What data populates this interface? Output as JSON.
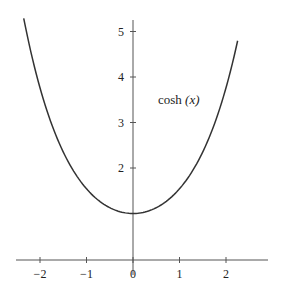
{
  "chart_data": {
    "type": "line",
    "title": "",
    "xlabel": "",
    "ylabel": "",
    "xlim": [
      -2.5,
      2.8
    ],
    "ylim": [
      0,
      5.3
    ],
    "grid": false,
    "x_ticks": [
      -2,
      -1,
      0,
      1,
      2
    ],
    "x_tick_labels": [
      "−2",
      "−1",
      "0",
      "1",
      "2"
    ],
    "y_ticks": [
      2,
      3,
      4,
      5
    ],
    "y_tick_labels": [
      "2",
      "3",
      "4",
      "5"
    ],
    "series": [
      {
        "name": "cosh (x)",
        "function": "cosh(x)",
        "domain": [
          -2.35,
          2.25
        ],
        "color": "#333333",
        "x": [
          -2.35,
          -2,
          -1.5,
          -1,
          -0.5,
          0,
          0.5,
          1,
          1.5,
          2,
          2.25
        ],
        "y": [
          5.29,
          3.76,
          2.35,
          1.54,
          1.13,
          1.0,
          1.13,
          1.54,
          2.35,
          3.76,
          4.79
        ]
      }
    ],
    "annotations": [
      {
        "text": "cosh (x)",
        "x": 0.8,
        "y": 3.6
      }
    ]
  },
  "labels": {
    "curve_label_main": "cosh ",
    "curve_label_arg": "(x)"
  }
}
